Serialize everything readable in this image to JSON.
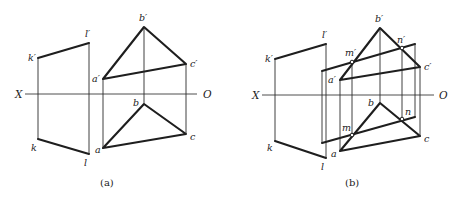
{
  "panels": [
    {
      "id": "a",
      "caption": "(a)",
      "axis": {
        "left_label": "X",
        "right_label": "O"
      },
      "labels": {
        "k_prime": "k′",
        "l_prime": "l′",
        "k": "k",
        "l": "l",
        "a_prime": "a′",
        "b_prime": "b′",
        "c_prime": "c′",
        "a": "a",
        "b": "b",
        "c": "c"
      }
    },
    {
      "id": "b",
      "caption": "(b)",
      "axis": {
        "left_label": "X",
        "right_label": "O"
      },
      "labels": {
        "k_prime": "k′",
        "l_prime": "l′",
        "k": "k",
        "l": "l",
        "a_prime": "a′",
        "b_prime": "b′",
        "c_prime": "c′",
        "a": "a",
        "b": "b",
        "c": "c",
        "m_prime": "m′",
        "n_prime": "n′",
        "m": "m",
        "n": "n"
      }
    }
  ]
}
